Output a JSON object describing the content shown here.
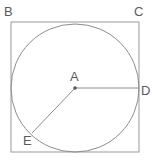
{
  "figure": {
    "kind": "geometry-diagram",
    "width": 152,
    "height": 162,
    "background_color": "#ffffff",
    "stroke_color": "#9a9a9a",
    "circle_stroke_color": "#8c8c8c",
    "radius_stroke_color": "#8c8c8c",
    "label_color": "#5a5a5a",
    "center_dot_color": "#555555"
  },
  "square": {
    "name": "bounding-square",
    "x": 11,
    "y": 22,
    "width": 128,
    "height": 130,
    "stroke_width": 1
  },
  "circle": {
    "name": "inscribed-circle",
    "center_x": 75,
    "center_y": 88,
    "radius": 64,
    "stroke_width": 1
  },
  "center_point": {
    "name": "center-A",
    "x": 75,
    "y": 88,
    "dot_radius": 1.8
  },
  "radii": [
    {
      "name": "radius-A-D",
      "from_label": "A",
      "to_label": "D",
      "x1": 75,
      "y1": 88,
      "x2": 139,
      "y2": 88,
      "stroke_width": 1
    },
    {
      "name": "radius-A-E",
      "from_label": "A",
      "to_label": "E",
      "x1": 75,
      "y1": 88,
      "x2": 32,
      "y2": 133,
      "stroke_width": 1
    }
  ],
  "labels": {
    "B": "B",
    "C": "C",
    "A": "A",
    "D": "D",
    "E": "E"
  }
}
